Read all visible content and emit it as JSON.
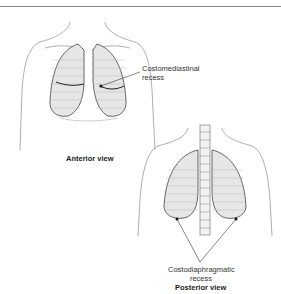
{
  "figure": {
    "anterior": {
      "caption": "Anterior view",
      "callout_line1": "Costomediastinal",
      "callout_line2": "recess"
    },
    "posterior": {
      "caption": "Posterior view",
      "callout_line1": "Costodiaphragmatic",
      "callout_line2": "recess"
    }
  }
}
